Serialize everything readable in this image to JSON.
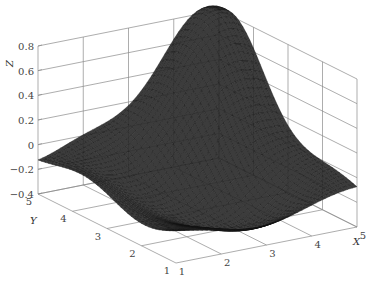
{
  "chart_data": {
    "type": "surface3d",
    "title": "",
    "xlabel": "X",
    "ylabel": "Y",
    "zlabel": "Z",
    "xlim": [
      1,
      5
    ],
    "ylim": [
      1,
      5
    ],
    "zlim": [
      -0.4,
      0.8
    ],
    "x_ticks": [
      "1",
      "2",
      "3",
      "4",
      "5"
    ],
    "y_ticks": [
      "1",
      "2",
      "3",
      "4",
      "5"
    ],
    "z_ticks": [
      "-0.4",
      "-0.2",
      "0",
      "0.2",
      "0.4",
      "0.6",
      "0.8"
    ],
    "grid": true,
    "colormap": "gray (dark mesh)",
    "surface_description": "Single peak near (X≈4.5, Y≈4.5) reaching Z≈0.7; surface dips to about -0.3 near the front/center region; wavy edges rising to ~0 along the X=1 and Y=1 sides.",
    "peak": {
      "x": 4.6,
      "y": 4.6,
      "z": 0.7
    },
    "min_approx": {
      "x": 2.5,
      "y": 2.0,
      "z": -0.3
    }
  },
  "axes": {
    "z_label": "Z",
    "y_label": "Y",
    "x_label": "X"
  }
}
